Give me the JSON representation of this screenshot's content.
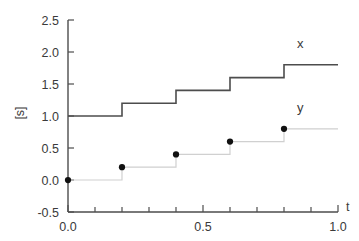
{
  "chart_data": {
    "type": "line",
    "title": "",
    "subtitle": "",
    "xlabel": "t",
    "ylabel": "[s]",
    "xlim": [
      0.0,
      1.0
    ],
    "ylim": [
      -0.5,
      2.5
    ],
    "grid": false,
    "legend_position": "inline-right",
    "x_ticks": [
      0.0,
      0.5,
      1.0
    ],
    "x_tick_labels": [
      "0.0",
      "0.5",
      "1.0"
    ],
    "x_minor_tick_step": 0.1,
    "y_ticks": [
      -0.5,
      0.0,
      0.5,
      1.0,
      1.5,
      2.0,
      2.5
    ],
    "y_tick_labels": [
      "-0.5",
      "0.0",
      "0.5",
      "1.0",
      "1.5",
      "2.0",
      "2.5"
    ],
    "series": [
      {
        "name": "x",
        "label": "x",
        "drawstyle": "steps-post",
        "color": "#4d4d4d",
        "linewidth": 1.6,
        "markers": false,
        "x": [
          0.0,
          0.2,
          0.4,
          0.6,
          0.8,
          1.0
        ],
        "values": [
          1.0,
          1.2,
          1.4,
          1.6,
          1.8,
          1.8
        ]
      },
      {
        "name": "y",
        "label": "y",
        "drawstyle": "steps-post",
        "color": "#d0d0d0",
        "linewidth": 1.2,
        "markers": true,
        "marker_color": "#111111",
        "marker_size": 5,
        "x": [
          0.0,
          0.2,
          0.4,
          0.6,
          0.8,
          1.0
        ],
        "values": [
          0.0,
          0.2,
          0.4,
          0.6,
          0.8,
          0.8
        ],
        "marker_points": [
          {
            "x": 0.0,
            "y": 0.0
          },
          {
            "x": 0.2,
            "y": 0.2
          },
          {
            "x": 0.4,
            "y": 0.4
          },
          {
            "x": 0.6,
            "y": 0.6
          },
          {
            "x": 0.8,
            "y": 0.8
          }
        ]
      }
    ],
    "annotations": [
      {
        "name": "series-label-x",
        "text": "x",
        "x": 0.86,
        "y": 2.06
      },
      {
        "name": "series-label-y",
        "text": "y",
        "x": 0.86,
        "y": 1.06
      }
    ]
  },
  "axes": {
    "x_axis_name": "t",
    "y_axis_name": "[s]"
  }
}
